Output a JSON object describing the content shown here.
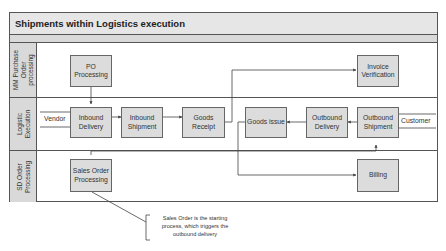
{
  "diagram": {
    "title": "Shipments within Logistics execution",
    "lanes": [
      {
        "label": "MM Purchase\nOrder\nprocessing"
      },
      {
        "label": "Logistic\nExecution"
      },
      {
        "label": "SD Order\nProcessing"
      }
    ],
    "nodes": {
      "po_processing": "PO\nProcessing",
      "invoice_verification": "Invoice\nVerification",
      "inbound_delivery": "Inbound\nDelivery",
      "inbound_shipment": "Inbound\nShipment",
      "goods_receipt": "Goods\nReceipt",
      "goods_issue": "Goods issue",
      "outbound_delivery": "Outbound\nDelivery",
      "outbound_shipment": "Outbound\nShipment",
      "sales_order_processing": "Sales Order\nProcessing",
      "billing": "Billing"
    },
    "external": {
      "vendor": "Vendor",
      "customer": "Customer"
    },
    "callout": "Sales Order is the starting\nprocess, which triggers the\noutbound delivery",
    "colors": {
      "box_fill": "#dcdcdc",
      "lane_label_fill": "#d9d9d9",
      "title_fill": "#e6e6e6",
      "line": "#444444"
    }
  }
}
